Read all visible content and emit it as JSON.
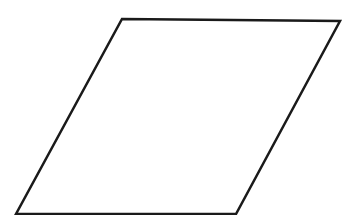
{
  "diagram": {
    "shape": "parallelogram",
    "stroke_color": "#1a1a1a",
    "fill_color": "#ffffff",
    "stroke_width": 2.5,
    "vertices": [
      {
        "x": 122,
        "y": 19
      },
      {
        "x": 340,
        "y": 21
      },
      {
        "x": 236,
        "y": 214
      },
      {
        "x": 16,
        "y": 214
      }
    ]
  }
}
